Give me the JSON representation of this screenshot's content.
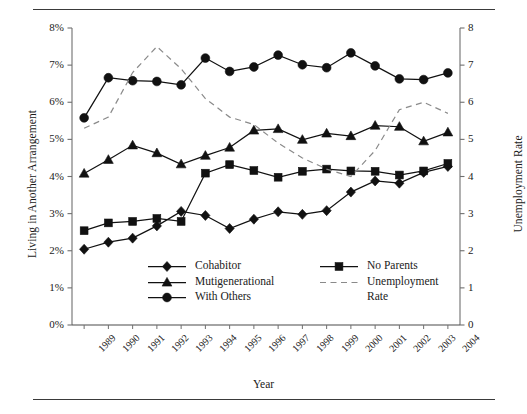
{
  "figure": {
    "x_axis_title": "Year",
    "y_axis_title_left": "Living in Another Arrangement",
    "y_axis_title_right": "Unemployment Rate"
  },
  "legend": {
    "entries": [
      {
        "label": "Cohabitor",
        "marker": "diamond-marker",
        "style": "solid"
      },
      {
        "label": "Mutigenerational",
        "marker": "triangle-marker",
        "style": "solid"
      },
      {
        "label": "With Others",
        "marker": "circle-marker",
        "style": "solid"
      },
      {
        "label": "No Parents",
        "marker": "square-marker",
        "style": "solid"
      },
      {
        "label": "Unemployment",
        "label2": "Rate",
        "marker": "dashed-line",
        "style": "dashed"
      }
    ]
  },
  "chart_data": {
    "type": "line",
    "title": "",
    "xlabel": "Year",
    "ylabel": "Living in Another Arrangement",
    "ylabel_right": "Unemployment Rate",
    "grid": false,
    "legend_position": "inside-bottom-center",
    "categories": [
      "1989",
      "1990",
      "1991",
      "1992",
      "1993",
      "1994",
      "1995",
      "1996",
      "1997",
      "1998",
      "1999",
      "2000",
      "2001",
      "2002",
      "2003",
      "2004"
    ],
    "ylim": [
      0,
      8
    ],
    "yticks": [
      "0%",
      "1%",
      "2%",
      "3%",
      "4%",
      "5%",
      "6%",
      "7%",
      "8%"
    ],
    "ylim_right": [
      0,
      8
    ],
    "yticks_right": [
      "0",
      "1",
      "2",
      "3",
      "4",
      "5",
      "6",
      "7",
      "8"
    ],
    "series": [
      {
        "name": "Cohabitor",
        "axis": "left",
        "units": "percent",
        "marker": "diamond",
        "style": "solid",
        "values": [
          2.04,
          2.23,
          2.34,
          2.67,
          3.06,
          2.95,
          2.6,
          2.85,
          3.05,
          2.98,
          3.08,
          3.58,
          3.88,
          3.82,
          4.11,
          4.27
        ]
      },
      {
        "name": "Mutigenerational",
        "axis": "left",
        "units": "percent",
        "marker": "triangle",
        "style": "solid",
        "values": [
          4.08,
          4.45,
          4.84,
          4.63,
          4.33,
          4.56,
          4.78,
          5.24,
          5.28,
          4.99,
          5.16,
          5.09,
          5.37,
          5.34,
          4.95,
          5.19
        ]
      },
      {
        "name": "With Others",
        "axis": "left",
        "units": "percent",
        "marker": "circle",
        "style": "solid",
        "values": [
          5.58,
          6.66,
          6.58,
          6.56,
          6.47,
          7.19,
          6.83,
          6.95,
          7.27,
          7.01,
          6.93,
          7.33,
          6.98,
          6.63,
          6.61,
          6.79
        ]
      },
      {
        "name": "No Parents",
        "axis": "left",
        "units": "percent",
        "marker": "square",
        "style": "solid",
        "values": [
          2.54,
          2.75,
          2.79,
          2.87,
          2.79,
          4.09,
          4.32,
          4.16,
          3.98,
          4.14,
          4.2,
          4.15,
          4.14,
          4.04,
          4.15,
          4.35
        ]
      },
      {
        "name": "Unemployment Rate",
        "axis": "right",
        "units": "rate",
        "marker": "none",
        "style": "dashed",
        "values": [
          5.3,
          5.6,
          6.8,
          7.5,
          6.9,
          6.1,
          5.6,
          5.4,
          4.9,
          4.5,
          4.2,
          4.0,
          4.7,
          5.8,
          6.0,
          5.7
        ]
      }
    ]
  }
}
